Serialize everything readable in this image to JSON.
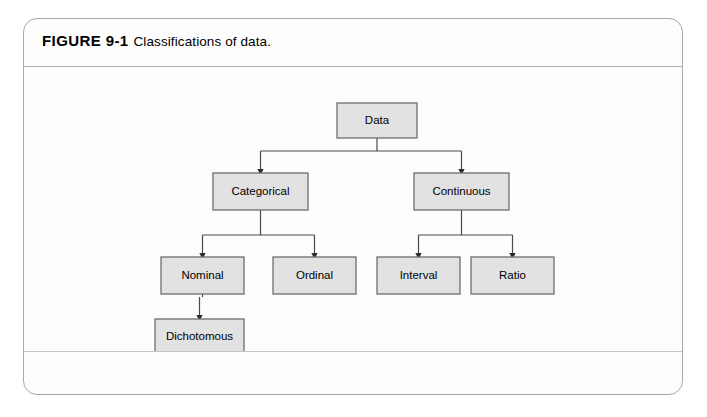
{
  "figure": {
    "label": "FIGURE 9-1",
    "description": "Classifications of data.",
    "frame_border_color": "#a8a8a8",
    "page_background": "#ffffff"
  },
  "diagram": {
    "type": "tree-flowchart",
    "node_fill_color": "#e2e2e2",
    "node_border_color": "#6d6d6d",
    "connector_color": "#4a4a4a",
    "nodes": [
      {
        "id": "data",
        "label": "Data",
        "level": 0,
        "x": 313,
        "y": 36,
        "w": 80,
        "h": 35
      },
      {
        "id": "categorical",
        "label": "Categorical",
        "level": 1,
        "x": 189,
        "y": 106,
        "w": 95,
        "h": 37
      },
      {
        "id": "continuous",
        "label": "Continuous",
        "level": 1,
        "x": 390,
        "y": 106,
        "w": 95,
        "h": 37
      },
      {
        "id": "nominal",
        "label": "Nominal",
        "level": 2,
        "x": 137,
        "y": 190,
        "w": 83,
        "h": 37
      },
      {
        "id": "ordinal",
        "label": "Ordinal",
        "level": 2,
        "x": 249,
        "y": 190,
        "w": 83,
        "h": 37
      },
      {
        "id": "interval",
        "label": "Interval",
        "level": 2,
        "x": 353,
        "y": 190,
        "w": 83,
        "h": 37
      },
      {
        "id": "ratio",
        "label": "Ratio",
        "level": 2,
        "x": 447,
        "y": 190,
        "w": 83,
        "h": 37
      },
      {
        "id": "dichotomous",
        "label": "Dichotomous",
        "level": 3,
        "x": 131,
        "y": 252,
        "w": 89,
        "h": 35
      }
    ],
    "edges": [
      {
        "from": "data",
        "to": "categorical"
      },
      {
        "from": "data",
        "to": "continuous"
      },
      {
        "from": "categorical",
        "to": "nominal"
      },
      {
        "from": "categorical",
        "to": "ordinal"
      },
      {
        "from": "continuous",
        "to": "interval"
      },
      {
        "from": "continuous",
        "to": "ratio"
      },
      {
        "from": "nominal",
        "to": "dichotomous"
      }
    ]
  }
}
